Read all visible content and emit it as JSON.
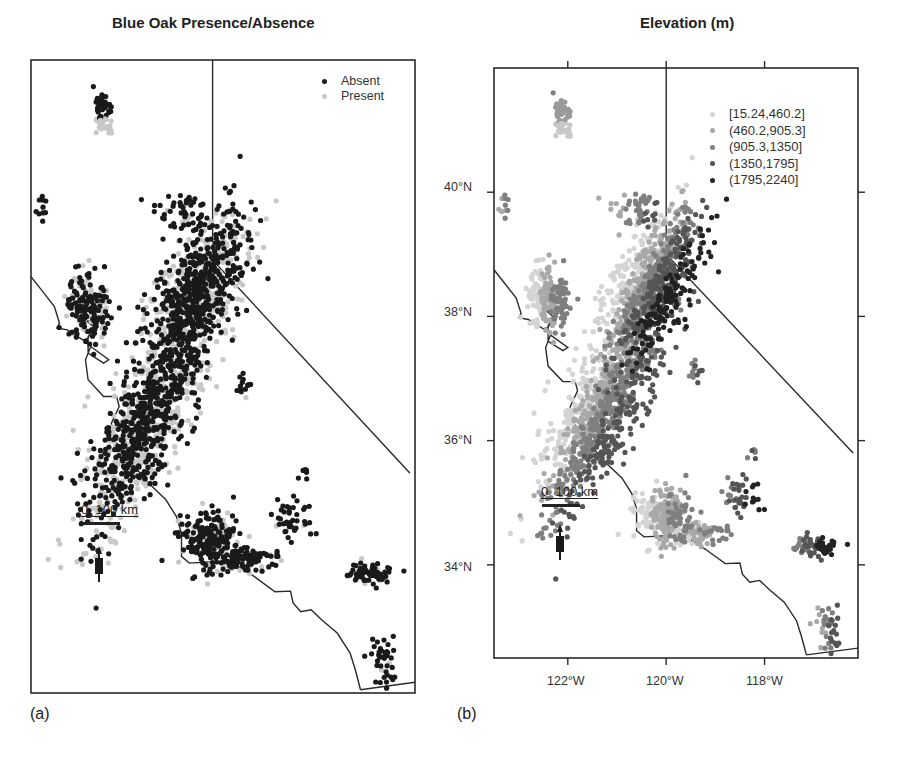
{
  "figure": {
    "panels": [
      {
        "id": "a",
        "title": "Blue Oak Presence/Absence",
        "label": "(a)",
        "frame": {
          "x": 31,
          "y": 60,
          "w": 384,
          "h": 633
        },
        "legend": {
          "x": 322,
          "y": 74,
          "items": [
            {
              "label": "Absent",
              "color": "#1a1a1a"
            },
            {
              "label": "Present",
              "color": "#c8c8c8"
            }
          ]
        },
        "scale_bar": {
          "text": "0  100 km",
          "x": 81,
          "y": 502
        },
        "north_arrow": {
          "x": 99,
          "y": 552
        },
        "axes": false
      },
      {
        "id": "b",
        "title": "Elevation (m)",
        "label": "(b)",
        "frame": {
          "x": 494,
          "y": 68,
          "w": 364,
          "h": 590
        },
        "legend": {
          "x": 710,
          "y": 106,
          "items": [
            {
              "label": "[15.24,460.2]",
              "color": "#d4d4d4"
            },
            {
              "label": "(460.2,905.3]",
              "color": "#a9a9a9"
            },
            {
              "label": "(905.3,1350]",
              "color": "#7f7f7f"
            },
            {
              "label": "(1350,1795]",
              "color": "#555555"
            },
            {
              "label": "(1795,2240]",
              "color": "#222222"
            }
          ]
        },
        "scale_bar": {
          "text": "0  100 km",
          "x": 541,
          "y": 484
        },
        "north_arrow": {
          "x": 560,
          "y": 530
        },
        "axes": true
      }
    ],
    "axes": {
      "y_ticks": [
        {
          "label": "40°N",
          "lat": 40
        },
        {
          "label": "38°N",
          "lat": 38
        },
        {
          "label": "36°N",
          "lat": 36
        },
        {
          "label": "34°N",
          "lat": 34
        }
      ],
      "x_ticks": [
        {
          "label": "122°W",
          "lon": -122
        },
        {
          "label": "120°W",
          "lon": -120
        },
        {
          "label": "118°W",
          "lon": -118
        }
      ],
      "extent": {
        "lon_min": -123.5,
        "lon_max": -116.1,
        "lat_min": 32.5,
        "lat_max": 42.0
      }
    }
  },
  "chart_data": {
    "type": "scatter",
    "title": [
      "Blue Oak Presence/Absence",
      "Elevation (m)"
    ],
    "xlabel": "Longitude",
    "ylabel": "Latitude",
    "x_ticks": [
      "122°W",
      "120°W",
      "118°W"
    ],
    "y_ticks": [
      "40°N",
      "38°N",
      "36°N",
      "34°N"
    ],
    "legend_a": [
      "Absent",
      "Present"
    ],
    "legend_b": [
      "[15.24,460.2]",
      "(460.2,905.3]",
      "(905.3,1350]",
      "(1350,1795]",
      "(1795,2240]"
    ],
    "scale_bar": "0 100 km",
    "regions": [
      {
        "name": "north-block",
        "cx": -122.1,
        "cy": 41.2,
        "rx": 0.15,
        "ry": 0.3,
        "n": 60,
        "present_frac": 0.4,
        "elev": [
          1,
          2
        ],
        "shape": "box"
      },
      {
        "name": "far-north-dot",
        "cx": -122.3,
        "cy": 41.6,
        "rx": 0.02,
        "ry": 0.02,
        "n": 1,
        "present_frac": 0,
        "elev": [
          2,
          2
        ]
      },
      {
        "name": "nw-coast-cluster",
        "cx": -123.3,
        "cy": 39.8,
        "rx": 0.1,
        "ry": 0.2,
        "n": 10,
        "present_frac": 0.2,
        "elev": [
          1,
          2
        ]
      },
      {
        "name": "sierra-north",
        "cx": -120.6,
        "cy": 39.7,
        "rx": 0.5,
        "ry": 0.3,
        "n": 50,
        "present_frac": 0.25,
        "elev": [
          1,
          3
        ]
      },
      {
        "name": "sierra-foothills",
        "cx": -120.3,
        "cy": 38.5,
        "rx": 0.55,
        "ry": 1.2,
        "n": 900,
        "present_frac": 0.35,
        "elev": [
          0,
          4
        ],
        "angle": -35
      },
      {
        "name": "sierra-south-small",
        "cx": -119.4,
        "cy": 37.2,
        "rx": 0.1,
        "ry": 0.15,
        "n": 14,
        "present_frac": 0.3,
        "elev": [
          2,
          3
        ]
      },
      {
        "name": "coast-range-north",
        "cx": -122.4,
        "cy": 38.3,
        "rx": 0.35,
        "ry": 0.4,
        "n": 200,
        "present_frac": 0.35,
        "elev": [
          0,
          2
        ]
      },
      {
        "name": "coast-range-central",
        "cx": -121.3,
        "cy": 36.5,
        "rx": 0.55,
        "ry": 1.5,
        "n": 1000,
        "present_frac": 0.45,
        "elev": [
          0,
          3
        ],
        "angle": -35
      },
      {
        "name": "transverse",
        "cx": -120.0,
        "cy": 34.8,
        "rx": 0.45,
        "ry": 0.35,
        "n": 250,
        "present_frac": 0.3,
        "elev": [
          0,
          2
        ]
      },
      {
        "name": "sb-coast",
        "cx": -119.3,
        "cy": 34.5,
        "rx": 0.5,
        "ry": 0.15,
        "n": 90,
        "present_frac": 0.15,
        "elev": [
          0,
          2
        ]
      },
      {
        "name": "tehachapi",
        "cx": -118.5,
        "cy": 35.1,
        "rx": 0.3,
        "ry": 0.25,
        "n": 40,
        "present_frac": 0.1,
        "elev": [
          2,
          4
        ]
      },
      {
        "name": "kern-north",
        "cx": -118.2,
        "cy": 35.8,
        "rx": 0.15,
        "ry": 0.1,
        "n": 6,
        "present_frac": 0.1,
        "elev": [
          2,
          3
        ]
      },
      {
        "name": "san-gabriel",
        "cx": -117.0,
        "cy": 34.3,
        "rx": 0.35,
        "ry": 0.15,
        "n": 70,
        "present_frac": 0.05,
        "elev": [
          2,
          4
        ]
      },
      {
        "name": "peninsular",
        "cx": -116.7,
        "cy": 33.0,
        "rx": 0.2,
        "ry": 0.35,
        "n": 40,
        "present_frac": 0.05,
        "elev": [
          1,
          3
        ]
      }
    ]
  }
}
